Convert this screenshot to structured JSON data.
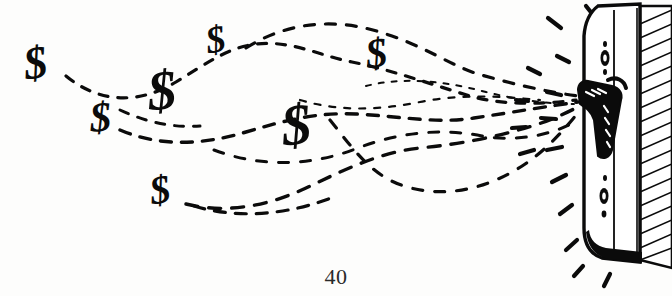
{
  "page": {
    "number": "40",
    "background_color": "#fdfdfc",
    "ink_color": "#0b0b0b",
    "width": 672,
    "height": 296
  },
  "illustration": {
    "title": "Money flying out of a wallet",
    "style": "black-and-white pen-and-ink line drawing",
    "dollar_symbol": "$",
    "dollars": [
      {
        "id": "dollar-1",
        "label": "$",
        "x": 24,
        "y": 40,
        "size": 46,
        "rotate": -8
      },
      {
        "id": "dollar-2",
        "label": "$",
        "x": 90,
        "y": 96,
        "size": 42,
        "rotate": -4
      },
      {
        "id": "dollar-3",
        "label": "$",
        "x": 148,
        "y": 62,
        "size": 56,
        "rotate": -5
      },
      {
        "id": "dollar-4",
        "label": "$",
        "x": 206,
        "y": 20,
        "size": 38,
        "rotate": -10
      },
      {
        "id": "dollar-5",
        "label": "$",
        "x": 282,
        "y": 96,
        "size": 58,
        "rotate": -6
      },
      {
        "id": "dollar-6",
        "label": "$",
        "x": 366,
        "y": 32,
        "size": 42,
        "rotate": -7
      },
      {
        "id": "dollar-7",
        "label": "$",
        "x": 150,
        "y": 170,
        "size": 40,
        "rotate": -9
      }
    ],
    "wallet": {
      "name": "wallet",
      "description": "upright wallet seen edge-on with a metal clasp, hatched spine and dark shaded base",
      "clasp": "metal clasp latch",
      "spine_shading": "diagonal hatching",
      "stud_marks": 2
    },
    "motion": {
      "trajectory_style": "dashed curved flight paths",
      "trajectory_count": 5,
      "burst_description": "short radiating dashes around the wallet clasp"
    }
  }
}
